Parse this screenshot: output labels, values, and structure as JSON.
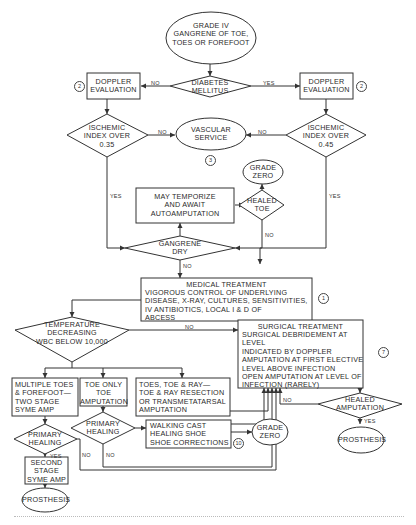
{
  "diagram": {
    "type": "flowchart",
    "topic": "Management of Grade IV gangrene of toe, toes or forefoot",
    "nodes": {
      "start": {
        "shape": "ellipse",
        "text": "GRADE IV\nGANGRENE OF TOE,\nTOES OR FOREFOOT"
      },
      "diabetes": {
        "shape": "diamond",
        "text": "DIABETES\nMELLITUS"
      },
      "doppler_left": {
        "shape": "rect",
        "text": "DOPPLER\nEVALUATION",
        "ref": "2"
      },
      "doppler_right": {
        "shape": "rect",
        "text": "DOPPLER\nEVALUATION",
        "ref": "2"
      },
      "ischemic_left": {
        "shape": "diamond",
        "text": "ISCHEMIC\nINDEX OVER\n0.35"
      },
      "ischemic_right": {
        "shape": "diamond",
        "text": "ISCHEMIC\nINDEX OVER\n0.45"
      },
      "vascular": {
        "shape": "ellipse",
        "text": "VASCULAR\nSERVICE",
        "ref": "3"
      },
      "grade_zero_top": {
        "shape": "ellipse",
        "text": "GRADE\nZERO"
      },
      "healed_toe": {
        "shape": "diamond",
        "text": "HEALED\nTOE"
      },
      "temporize": {
        "shape": "rect",
        "text": "MAY TEMPORIZE\nAND AWAIT\nAUTOAMPUTATION"
      },
      "gangrene_dry": {
        "shape": "diamond",
        "text": "GANGRENE\nDRY"
      },
      "medical": {
        "shape": "rect",
        "title": "MEDICAL TREATMENT",
        "text": "VIGOROUS CONTROL OF UNDERLYING\nDISEASE, X-RAY, CULTURES, SENSITIVITIES,\nIV ANTIBIOTICS, LOCAL I & D OF\nABCESS",
        "ref": "1"
      },
      "temperature": {
        "shape": "diamond",
        "text": "TEMPERATURE\nDECREASING\nWBC BELOW 10,000"
      },
      "surgical": {
        "shape": "rect",
        "title": "SURGICAL TREATMENT",
        "text": "SURGICAL DEBRIDEMENT AT LEVEL\nINDICATED BY DOPPLER\nAMPUTATION AT FIRST ELECTIVE\nLEVEL ABOVE INFECTION\nOPEN AMPUTATION AT LEVEL OF\nINFECTION (RARELY)",
        "ref": "7"
      },
      "multiple_toes": {
        "shape": "rect",
        "text": "MULTIPLE TOES\n& FOREFOOT—\nTWO STAGE\nSYME AMP"
      },
      "toe_only": {
        "shape": "rect",
        "text": "TOE ONLY\nTOE\nAMPUTATION"
      },
      "toes_ray": {
        "shape": "rect",
        "text": "TOES, TOE & RAY—\nTOE & RAY RESECTION\nOR TRANSMETATARSAL\nAMPUTATION"
      },
      "primary_healing_left": {
        "shape": "diamond",
        "text": "PRIMARY\nHEALING"
      },
      "primary_healing_mid": {
        "shape": "diamond",
        "text": "PRIMARY\nHEALING"
      },
      "walking_cast": {
        "shape": "rect",
        "text": "WALKING CAST\nHEALING SHOE\nSHOE CORRECTIONS",
        "ref": "10"
      },
      "grade_zero_bottom": {
        "shape": "ellipse",
        "text": "GRADE\nZERO"
      },
      "second_stage": {
        "shape": "rect",
        "text": "SECOND\nSTAGE\nSYME AMP"
      },
      "prosthesis_left": {
        "shape": "ellipse",
        "text": "PROSTHESIS"
      },
      "healed_amputation": {
        "shape": "diamond",
        "text": "HEALED\nAMPUTATION"
      },
      "prosthesis_right": {
        "shape": "ellipse",
        "text": "PROSTHESIS"
      }
    },
    "labels": {
      "no": "NO",
      "yes": "YES"
    },
    "edges": [
      {
        "from": "start",
        "to": "diabetes"
      },
      {
        "from": "diabetes",
        "to": "doppler_left",
        "label": "NO"
      },
      {
        "from": "diabetes",
        "to": "doppler_right",
        "label": "YES"
      },
      {
        "from": "doppler_left",
        "to": "ischemic_left"
      },
      {
        "from": "doppler_right",
        "to": "ischemic_right"
      },
      {
        "from": "ischemic_left",
        "to": "vascular",
        "label": "NO"
      },
      {
        "from": "ischemic_right",
        "to": "vascular",
        "label": "NO"
      },
      {
        "from": "ischemic_left",
        "to": "gangrene_dry",
        "label": "YES"
      },
      {
        "from": "ischemic_right",
        "to": "medical",
        "label": "YES"
      },
      {
        "from": "gangrene_dry",
        "to": "temporize"
      },
      {
        "from": "temporize",
        "to": "healed_toe"
      },
      {
        "from": "healed_toe",
        "to": "grade_zero_top"
      },
      {
        "from": "healed_toe",
        "to": "gangrene_dry",
        "label": "NO"
      },
      {
        "from": "gangrene_dry",
        "to": "medical",
        "label": "NO"
      },
      {
        "from": "medical",
        "to": "temperature"
      },
      {
        "from": "temperature",
        "to": "surgical",
        "label": "NO"
      },
      {
        "from": "temperature",
        "to": "multiple_toes"
      },
      {
        "from": "temperature",
        "to": "toe_only"
      },
      {
        "from": "temperature",
        "to": "toes_ray"
      },
      {
        "from": "multiple_toes",
        "to": "primary_healing_left"
      },
      {
        "from": "toe_only",
        "to": "primary_healing_mid"
      },
      {
        "from": "primary_healing_mid",
        "to": "walking_cast"
      },
      {
        "from": "toes_ray",
        "to": "surgical"
      },
      {
        "from": "walking_cast",
        "to": "grade_zero_bottom"
      },
      {
        "from": "primary_healing_left",
        "to": "second_stage",
        "label": "YES"
      },
      {
        "from": "second_stage",
        "to": "prosthesis_left"
      },
      {
        "from": "primary_healing_left",
        "to": "surgical",
        "label": "NO"
      },
      {
        "from": "primary_healing_mid",
        "to": "surgical",
        "label": "NO"
      },
      {
        "from": "surgical",
        "to": "healed_amputation"
      },
      {
        "from": "healed_amputation",
        "to": "surgical",
        "label": "NO"
      },
      {
        "from": "healed_amputation",
        "to": "prosthesis_right",
        "label": "YES"
      }
    ]
  }
}
